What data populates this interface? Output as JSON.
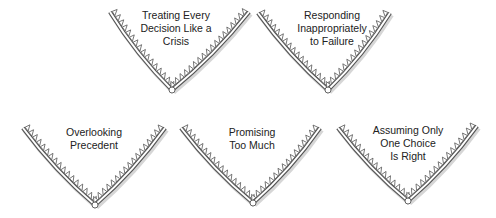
{
  "diagram": {
    "title": "",
    "colors": {
      "stroke": "#555555",
      "fill": "#ffffff",
      "shadow": "#bbbbbb",
      "text": "#222222"
    },
    "shapes": [
      {
        "label_lines": [
          "Treating Every",
          "Decision Like a",
          "Crisis"
        ],
        "left": [
          110,
          12
        ],
        "right": [
          249,
          12
        ],
        "bottom": [
          172,
          90
        ],
        "text_x": 176,
        "text_y": 9
      },
      {
        "label_lines": [
          "Responding",
          "Inappropriately",
          "to Failure"
        ],
        "left": [
          258,
          13
        ],
        "right": [
          390,
          13
        ],
        "bottom": [
          328,
          90
        ],
        "text_x": 332,
        "text_y": 9
      },
      {
        "label_lines": [
          "Overlooking",
          "Precedent"
        ],
        "left": [
          23,
          128
        ],
        "right": [
          165,
          128
        ],
        "bottom": [
          95,
          205
        ],
        "text_x": 94,
        "text_y": 126
      },
      {
        "label_lines": [
          "Promising",
          "Too Much"
        ],
        "left": [
          181,
          128
        ],
        "right": [
          320,
          128
        ],
        "bottom": [
          253,
          203
        ],
        "text_x": 252,
        "text_y": 126
      },
      {
        "label_lines": [
          "Assuming Only",
          "One Choice",
          "Is Right"
        ],
        "left": [
          338,
          128
        ],
        "right": [
          477,
          126
        ],
        "bottom": [
          408,
          201
        ],
        "text_x": 408,
        "text_y": 124
      }
    ]
  }
}
